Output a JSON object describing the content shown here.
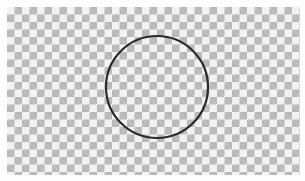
{
  "canvas": {
    "background": "transparency-checkerboard",
    "checker_dark": "#b9b9b9",
    "checker_light": "#f2f2f2"
  },
  "shape": {
    "type": "circle-outline",
    "stroke_color": "#2a2a2a",
    "fill": "none"
  }
}
